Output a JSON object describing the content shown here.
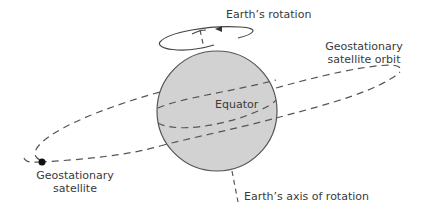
{
  "diagram": {
    "labels": {
      "earth_rotation": "Earth’s rotation",
      "orbit_line1": "Geostationary",
      "orbit_line2": "satellite orbit",
      "equator": "Equator",
      "satellite_line1": "Geostationary",
      "satellite_line2": "satellite",
      "axis": "Earth’s axis of rotation"
    },
    "colors": {
      "earth_fill": "#d2d2d2",
      "stroke": "#555555",
      "text": "#3a3a3a",
      "satellite": "#111111"
    },
    "icons": {
      "rotation_arrow": "arrow-left-icon",
      "satellite": "satellite-dot-icon"
    }
  }
}
